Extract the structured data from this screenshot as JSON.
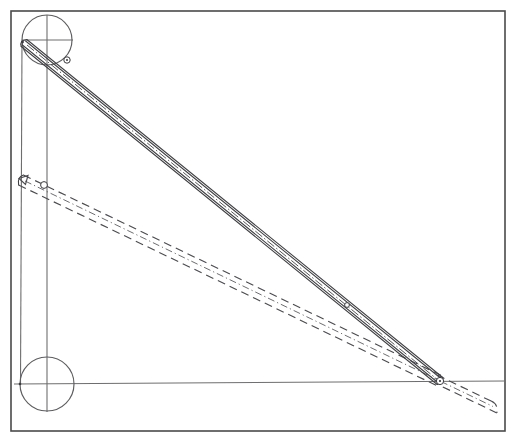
{
  "diagram": {
    "canvas": {
      "width": 517,
      "height": 445,
      "background": "#ffffff"
    },
    "frame": {
      "label": "drawing-border",
      "x": 11,
      "y": 11,
      "width": 494,
      "height": 420,
      "stroke": "#4a4a4a"
    },
    "joints": [
      {
        "name": "upper-pivot-circle",
        "label": "upper joint",
        "cx": 47,
        "cy": 40,
        "r": 25,
        "stroke": "#5d5d60"
      },
      {
        "name": "lower-pivot-circle",
        "label": "lower joint",
        "cx": 47,
        "cy": 384,
        "r": 27,
        "stroke": "#5d5d60"
      }
    ],
    "pivot_points": [
      {
        "name": "upper-left-pivot",
        "x": 22,
        "y": 41
      },
      {
        "name": "lower-left-pivot",
        "x": 20,
        "y": 384
      },
      {
        "name": "right-slider-pivot",
        "x": 440,
        "y": 381
      },
      {
        "name": "displaced-left-pivot",
        "x": 19,
        "y": 179
      }
    ],
    "construction_lines": [
      {
        "name": "upper-horizontal-diameter",
        "x1": 22,
        "y1": 40,
        "x2": 73,
        "y2": 40
      },
      {
        "name": "vertical-center-axis",
        "x1": 47,
        "y1": 15,
        "x2": 47,
        "y2": 412
      },
      {
        "name": "left-vertical-edge-line",
        "x1": 22,
        "y1": 41,
        "x2": 20,
        "y2": 384
      },
      {
        "name": "lower-horizontal-axis",
        "x1": 20,
        "y1": 384,
        "x2": 505,
        "y2": 381
      },
      {
        "name": "lower-circle-horizontal",
        "x1": 20,
        "y1": 384,
        "x2": 80,
        "y2": 384
      }
    ],
    "links": [
      {
        "name": "primary-link-solid",
        "style": "solid",
        "description": "connecting rod in current position",
        "from": {
          "x": 24,
          "y": 43
        },
        "to": {
          "x": 440,
          "y": 381
        },
        "half_width": 4.5,
        "centerline": "dash-dot"
      },
      {
        "name": "displaced-link-dashed",
        "style": "dashed",
        "description": "connecting rod in displaced position",
        "from": {
          "x": 21,
          "y": 180
        },
        "to": {
          "x": 440,
          "y": 381
        },
        "half_width": 5.5,
        "centerline": "dash-dot"
      },
      {
        "name": "extension-link-dashed",
        "style": "dashed",
        "description": "rod extension beyond right pivot",
        "from": {
          "x": 440,
          "y": 381
        },
        "to": {
          "x": 494,
          "y": 407
        },
        "half_width": 6.5,
        "centerline": "none"
      }
    ],
    "markers": [
      {
        "name": "upper-rod-pivot-ring",
        "x": 67,
        "y": 60,
        "r": 3.2
      },
      {
        "name": "displaced-rod-pivot-ring",
        "x": 44,
        "y": 185,
        "r": 3.4
      },
      {
        "name": "right-pivot-ring",
        "x": 440,
        "y": 381,
        "r": 3.6
      },
      {
        "name": "mid-rod-ring",
        "x": 347,
        "y": 305,
        "r": 2.4
      }
    ],
    "arrow": {
      "name": "displacement-arrow-head",
      "tip_x": 19,
      "tip_y": 179,
      "size": 9
    },
    "colors": {
      "frame": "#4a4a4a",
      "construction": "#6e6e70",
      "link_solid": "#404044",
      "link_dashed": "#4b4b50",
      "background": "#ffffff"
    }
  }
}
